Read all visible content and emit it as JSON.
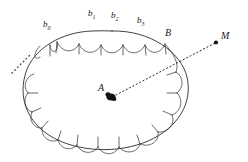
{
  "figure": {
    "type": "geometry-diagram",
    "background_color": "#ffffff",
    "stroke_color": "#2b2b2b",
    "labels": {
      "b0": {
        "base": "b",
        "sub": "0",
        "x": 44,
        "y": 21
      },
      "b1": {
        "base": "b",
        "sub": "1",
        "x": 89,
        "y": 10
      },
      "b2": {
        "base": "b",
        "sub": "2",
        "x": 112,
        "y": 12
      },
      "b3": {
        "base": "b",
        "sub": "3",
        "x": 138,
        "y": 17
      },
      "B": {
        "base": "B",
        "sub": "",
        "x": 166,
        "y": 29
      },
      "A": {
        "base": "A",
        "sub": "",
        "x": 99,
        "y": 84
      },
      "M": {
        "base": "M",
        "sub": "",
        "x": 222,
        "y": 32
      }
    },
    "points": [
      {
        "name": "A",
        "x": 110,
        "y": 97,
        "radius": 4.2,
        "filled": true
      },
      {
        "name": "M",
        "x": 217,
        "y": 42,
        "radius": 2.0,
        "filled": true
      }
    ],
    "ray": {
      "from": "A",
      "through": "B",
      "to": "M",
      "style": "dotted"
    },
    "ellipsis": {
      "style": "dotted-diagonal",
      "x1": 12,
      "y1": 72,
      "x2": 30,
      "y2": 54
    },
    "oval": {
      "cx": 112,
      "cy": 88,
      "rx": 82,
      "ry": 57,
      "rotation_deg": -6
    },
    "scallop_count": 20
  }
}
